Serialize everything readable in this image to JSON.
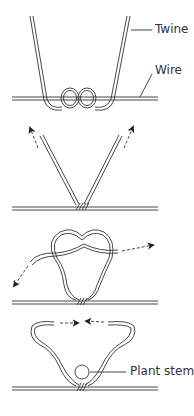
{
  "diagram": {
    "labels": {
      "twine": "Twine",
      "wire": "Wire",
      "plant_stem": "Plant stem"
    },
    "steps": [
      {
        "index": 1,
        "description": "Twine looped twice around the wire"
      },
      {
        "index": 2,
        "description": "Both ends pulled upward to tighten"
      },
      {
        "index": 3,
        "description": "Ends tied in a loose knot, pulled outward"
      },
      {
        "index": 4,
        "description": "Loop closed around plant stem"
      }
    ],
    "colors": {
      "line": "#333333",
      "background": "#ffffff"
    }
  }
}
